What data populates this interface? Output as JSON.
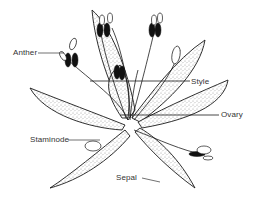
{
  "diagram": {
    "colors": {
      "background": "#ffffff",
      "outline": "#1a1a1a",
      "stipple": "#bdbdbd",
      "anther_fill": "#111111",
      "label_text": "#333333"
    },
    "labels": [
      {
        "id": "anther",
        "text": "Anther",
        "x": 13,
        "y": 52
      },
      {
        "id": "style",
        "text": "Style",
        "x": 193,
        "y": 78
      },
      {
        "id": "ovary",
        "text": "Ovary",
        "x": 222,
        "y": 112
      },
      {
        "id": "staminode",
        "text": "Staminode",
        "x": 31,
        "y": 138
      },
      {
        "id": "sepal",
        "text": "Sepal",
        "x": 116,
        "y": 175
      }
    ]
  }
}
